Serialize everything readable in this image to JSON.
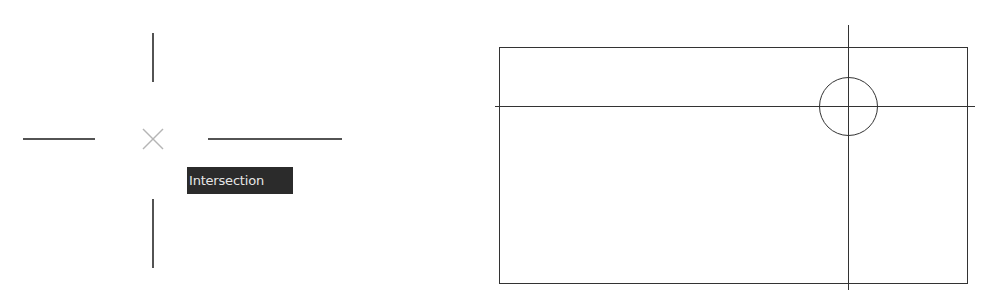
{
  "snap_panel": {
    "cursor_center": [
      153,
      139
    ],
    "crosshair_color": "#1a1a1a",
    "marker_color": "#b5b5b5",
    "marker_icon": "intersection-snap-x-icon",
    "tooltip": {
      "label": "Intersection",
      "background": "#2b2b2b",
      "text_color": "#e6e6e6"
    }
  },
  "drawing_panel": {
    "line_color": "#333333",
    "rectangle": {
      "x": 499,
      "y": 47,
      "width": 468,
      "height": 236
    },
    "vertical_line": {
      "x": 848,
      "y1": 25,
      "y2": 290
    },
    "horizontal_line": {
      "y": 106,
      "x1": 495,
      "x2": 975
    },
    "circle": {
      "cx": 848,
      "cy": 106,
      "r": 29
    }
  }
}
